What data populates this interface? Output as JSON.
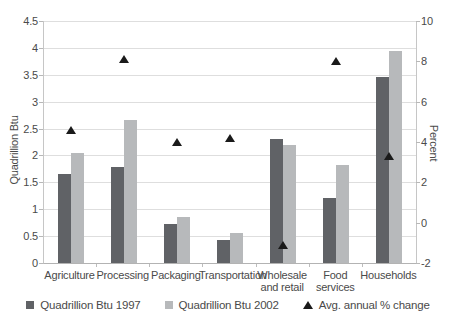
{
  "chart_data": {
    "type": "bar",
    "title": "",
    "categories": [
      "Agriculture",
      "Processing",
      "Packaging",
      "Transportation",
      "Wholesale and retail",
      "Food services",
      "Households"
    ],
    "category_slugs": [
      "agriculture",
      "processing",
      "packaging",
      "transportation",
      "wholesale-and-retail",
      "food-services",
      "households"
    ],
    "series": [
      {
        "name": "Quadrillion Btu 1997",
        "render": "bar",
        "axis": "left",
        "color": "#606266",
        "values": [
          1.65,
          1.78,
          0.72,
          0.43,
          2.3,
          1.2,
          3.45
        ]
      },
      {
        "name": "Quadrillion Btu 2002",
        "render": "bar",
        "axis": "left",
        "color": "#b7b9bb",
        "values": [
          2.05,
          2.65,
          0.85,
          0.55,
          2.2,
          1.82,
          3.95
        ]
      },
      {
        "name": "Avg. annual % change",
        "render": "triangle-scatter",
        "axis": "right",
        "color": "#1a1a1a",
        "values": [
          4.6,
          8.1,
          4.0,
          4.2,
          -1.1,
          8.0,
          3.3
        ]
      }
    ],
    "left_axis": {
      "label": "Quadrillion Btu",
      "min": 0,
      "max": 4.5,
      "tick_step": 0.5,
      "ticks": [
        "4.5",
        "4",
        "3.5",
        "3",
        "2.5",
        "2",
        "1.5",
        "1",
        "0.5",
        "0"
      ]
    },
    "right_axis": {
      "label": "Percent",
      "min": -2,
      "max": 10,
      "tick_step": 2,
      "ticks": [
        "10",
        "8",
        "6",
        "4",
        "2",
        "0",
        "-2"
      ]
    },
    "grid": true,
    "legend_position": "bottom"
  },
  "colors": {
    "background": "#ffffff",
    "gridline": "#dedede",
    "axis_line": "#c6c6c6",
    "baseline": "#b3b3b3",
    "text": "#4a4a4a"
  }
}
